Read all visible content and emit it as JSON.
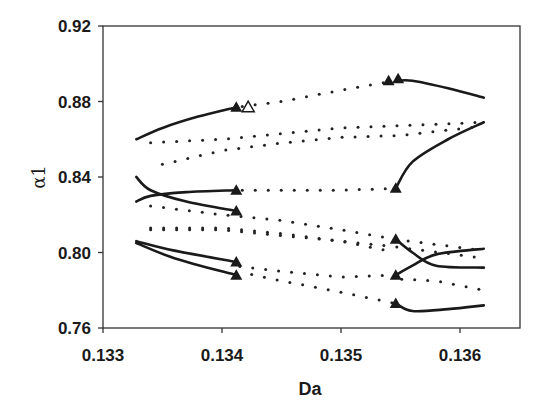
{
  "chart_data": {
    "type": "line",
    "title": "",
    "xlabel": "Da",
    "ylabel": "α1",
    "xlim": [
      0.133,
      0.1365
    ],
    "ylim": [
      0.76,
      0.92
    ],
    "x_ticks": [
      "0.133",
      "0.134",
      "0.135",
      "0.136"
    ],
    "y_ticks": [
      "0.92",
      "0.88",
      "0.84",
      "0.80",
      "0.76"
    ],
    "grid": false,
    "legend": null,
    "series": [
      {
        "name": "stable branch 1 (upper-left)",
        "style": "solid",
        "points": [
          [
            0.13328,
            0.86
          ],
          [
            0.1335,
            0.866
          ],
          [
            0.1338,
            0.872
          ],
          [
            0.13412,
            0.877
          ]
        ]
      },
      {
        "name": "stable branch 2 (crossing, descending)",
        "style": "solid",
        "points": [
          [
            0.13328,
            0.84
          ],
          [
            0.1334,
            0.833
          ],
          [
            0.1337,
            0.827
          ],
          [
            0.13412,
            0.822
          ]
        ]
      },
      {
        "name": "stable branch 3 (crossing, ascending)",
        "style": "solid",
        "points": [
          [
            0.13328,
            0.827
          ],
          [
            0.1334,
            0.83
          ],
          [
            0.1337,
            0.832
          ],
          [
            0.13412,
            0.833
          ]
        ]
      },
      {
        "name": "stable branch 4 (lower-left upper)",
        "style": "solid",
        "points": [
          [
            0.13328,
            0.806
          ],
          [
            0.1336,
            0.801
          ],
          [
            0.13412,
            0.795
          ]
        ]
      },
      {
        "name": "stable branch 5 (lower-left lower)",
        "style": "solid",
        "points": [
          [
            0.13328,
            0.805
          ],
          [
            0.1336,
            0.797
          ],
          [
            0.13412,
            0.788
          ]
        ]
      },
      {
        "name": "stable branch 6 (upper-right)",
        "style": "solid",
        "points": [
          [
            0.13548,
            0.891
          ],
          [
            0.1356,
            0.891
          ],
          [
            0.1359,
            0.887
          ],
          [
            0.1362,
            0.882
          ]
        ]
      },
      {
        "name": "stable branch 7 (right, rising)",
        "style": "solid",
        "points": [
          [
            0.13546,
            0.834
          ],
          [
            0.1356,
            0.848
          ],
          [
            0.1359,
            0.86
          ],
          [
            0.1362,
            0.869
          ]
        ]
      },
      {
        "name": "stable branch 8 (right crossing, upper end)",
        "style": "solid",
        "points": [
          [
            0.13546,
            0.807
          ],
          [
            0.1356,
            0.8
          ],
          [
            0.1358,
            0.793
          ],
          [
            0.1362,
            0.792
          ]
        ]
      },
      {
        "name": "stable branch 9 (right crossing, lower end)",
        "style": "solid",
        "points": [
          [
            0.13546,
            0.788
          ],
          [
            0.1356,
            0.793
          ],
          [
            0.1358,
            0.799
          ],
          [
            0.1362,
            0.802
          ]
        ]
      },
      {
        "name": "stable branch 10 (bottom-right)",
        "style": "solid",
        "points": [
          [
            0.13546,
            0.773
          ],
          [
            0.1356,
            0.769
          ],
          [
            0.1359,
            0.77
          ],
          [
            0.1362,
            0.772
          ]
        ]
      },
      {
        "name": "unstable 1 (upper dotted, to top triangles)",
        "style": "dotted",
        "points": [
          [
            0.13412,
            0.877
          ],
          [
            0.1345,
            0.88
          ],
          [
            0.135,
            0.886
          ],
          [
            0.13545,
            0.891
          ]
        ]
      },
      {
        "name": "unstable 2 (upper dotted)",
        "style": "dotted",
        "points": [
          [
            0.13335,
            0.858
          ],
          [
            0.134,
            0.86
          ],
          [
            0.1345,
            0.863
          ],
          [
            0.135,
            0.866
          ],
          [
            0.1362,
            0.869
          ]
        ]
      },
      {
        "name": "unstable 3 (upper dotted lower)",
        "style": "dotted",
        "points": [
          [
            0.13345,
            0.846
          ],
          [
            0.134,
            0.854
          ],
          [
            0.1345,
            0.858
          ],
          [
            0.135,
            0.861
          ],
          [
            0.1355,
            0.862
          ],
          [
            0.1362,
            0.867
          ]
        ]
      },
      {
        "name": "unstable 4 (horizontal dotted)",
        "style": "dotted",
        "points": [
          [
            0.13412,
            0.833
          ],
          [
            0.135,
            0.833
          ],
          [
            0.13546,
            0.834
          ]
        ]
      },
      {
        "name": "unstable 5",
        "style": "dotted",
        "points": [
          [
            0.13335,
            0.825
          ],
          [
            0.134,
            0.82
          ],
          [
            0.1345,
            0.817
          ],
          [
            0.135,
            0.812
          ],
          [
            0.13546,
            0.807
          ],
          [
            0.1362,
            0.801
          ]
        ]
      },
      {
        "name": "unstable 6",
        "style": "dotted",
        "points": [
          [
            0.13335,
            0.812
          ],
          [
            0.134,
            0.812
          ],
          [
            0.1345,
            0.809
          ],
          [
            0.135,
            0.806
          ],
          [
            0.13546,
            0.803
          ],
          [
            0.1362,
            0.797
          ]
        ]
      },
      {
        "name": "unstable 7",
        "style": "dotted",
        "points": [
          [
            0.13335,
            0.813
          ],
          [
            0.134,
            0.813
          ],
          [
            0.1345,
            0.81
          ],
          [
            0.135,
            0.806
          ],
          [
            0.13546,
            0.8
          ]
        ]
      },
      {
        "name": "unstable 8",
        "style": "dotted",
        "points": [
          [
            0.1341,
            0.793
          ],
          [
            0.1345,
            0.79
          ],
          [
            0.135,
            0.787
          ],
          [
            0.13546,
            0.788
          ]
        ]
      },
      {
        "name": "unstable 9",
        "style": "dotted",
        "points": [
          [
            0.1342,
            0.789
          ],
          [
            0.1345,
            0.785
          ],
          [
            0.135,
            0.779
          ],
          [
            0.13546,
            0.773
          ]
        ]
      },
      {
        "name": "unstable 10",
        "style": "dotted",
        "points": [
          [
            0.13546,
            0.786
          ],
          [
            0.1358,
            0.785
          ],
          [
            0.1362,
            0.78
          ]
        ]
      }
    ],
    "markers": {
      "filled_triangles": [
        [
          0.13412,
          0.877
        ],
        [
          0.13412,
          0.833
        ],
        [
          0.13412,
          0.822
        ],
        [
          0.13412,
          0.795
        ],
        [
          0.13412,
          0.788
        ],
        [
          0.1354,
          0.891
        ],
        [
          0.13548,
          0.892
        ],
        [
          0.13546,
          0.834
        ],
        [
          0.13546,
          0.807
        ],
        [
          0.13546,
          0.788
        ],
        [
          0.13546,
          0.773
        ]
      ],
      "open_triangles": [
        [
          0.13422,
          0.877
        ]
      ]
    }
  },
  "axes": {
    "xlabel": "Da",
    "ylabel": "α1",
    "x_ticks": [
      {
        "label": "0.133",
        "value": 0.133
      },
      {
        "label": "0.134",
        "value": 0.134
      },
      {
        "label": "0.135",
        "value": 0.135
      },
      {
        "label": "0.136",
        "value": 0.136
      }
    ],
    "y_ticks": [
      {
        "label": "0.92",
        "value": 0.92
      },
      {
        "label": "0.88",
        "value": 0.88
      },
      {
        "label": "0.84",
        "value": 0.84
      },
      {
        "label": "0.80",
        "value": 0.8
      },
      {
        "label": "0.76",
        "value": 0.76
      }
    ]
  },
  "colors": {
    "line": "#1a1a1a",
    "background": "#ffffff",
    "frame": "#333333"
  }
}
